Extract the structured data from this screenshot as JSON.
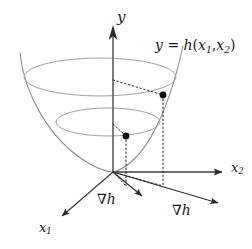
{
  "figure": {
    "type": "diagram",
    "background_color": "#ffffff",
    "axes": [
      {
        "id": "y",
        "label": "y",
        "label_plain": "y",
        "direction": "up",
        "color": "#6e6e6e",
        "arrow": true
      },
      {
        "id": "x2",
        "label": "x",
        "sub": "2",
        "label_plain": "x2",
        "direction": "right",
        "color": "#6e6e6e",
        "arrow": true
      },
      {
        "id": "x1",
        "label": "x",
        "sub": "1",
        "label_plain": "x1",
        "direction": "down-left",
        "color": "#3a3a3a",
        "arrow": true
      }
    ],
    "surface": {
      "name": "paraboloid",
      "equation_prefix": "y",
      "equation_eq": "=",
      "equation_func": "h",
      "equation_arg1": "x",
      "equation_arg1_sub": "1",
      "equation_arg2": "x",
      "equation_arg2_sub": "2",
      "equation_plain": "y = h(x1, x2)",
      "stroke_color": "#8c8c8c"
    },
    "contours": [
      {
        "id": "upper-contour",
        "level": "upper",
        "stroke_color": "#a0a0a0"
      },
      {
        "id": "lower-contour",
        "level": "lower",
        "stroke_color": "#a0a0a0"
      }
    ],
    "points": [
      {
        "id": "upper-point",
        "on": "upper-contour",
        "color": "#111111"
      },
      {
        "id": "lower-point",
        "on": "lower-contour",
        "color": "#111111"
      }
    ],
    "gradients": [
      {
        "id": "gradient-inner",
        "label_symbol": "∇",
        "label_var": "h",
        "label_plain": "grad h",
        "color": "#2b2b2b",
        "length": "short"
      },
      {
        "id": "gradient-outer",
        "label_symbol": "∇",
        "label_var": "h",
        "label_plain": "grad h",
        "color": "#2b2b2b",
        "length": "long"
      }
    ],
    "guides": {
      "style": "dotted",
      "color": "#2b2b2b",
      "items": [
        "radius from y-axis to upper point",
        "radius from y-axis to lower point",
        "vertical drop from upper point to x1-x2 plane",
        "vertical drop from lower point to x1-x2 plane",
        "ray from origin to lower point projection",
        "ray from origin to upper point projection"
      ]
    }
  }
}
